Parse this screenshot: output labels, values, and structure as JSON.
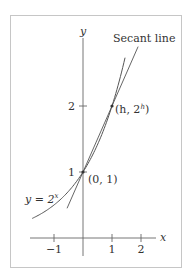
{
  "figure": {
    "frame_color": "#c6c6c6",
    "line_color": "#555555",
    "axis_color": "#666666",
    "labels": {
      "y_axis": "y",
      "x_axis": "x",
      "secant_line": "Secant line",
      "point_h": "(h, 2",
      "point_h_sup": "h",
      "point_h_close": ")",
      "point_origin": "(0, 1)",
      "curve_y": "y = 2",
      "curve_sup": "x"
    },
    "x_ticks": [
      {
        "value": -1,
        "label": "−1"
      },
      {
        "value": 1,
        "label": "1"
      },
      {
        "value": 2,
        "label": "2"
      }
    ],
    "y_ticks": [
      {
        "value": 1,
        "label": "1"
      },
      {
        "value": 2,
        "label": "2"
      }
    ]
  },
  "chart_data": {
    "type": "line",
    "title": "",
    "xlabel": "x",
    "ylabel": "y",
    "xlim": [
      -2.0,
      2.6
    ],
    "ylim": [
      -0.3,
      3.2
    ],
    "series": [
      {
        "name": "y = 2^x",
        "function": "2^x",
        "x_range": [
          -1.75,
          1.45
        ]
      },
      {
        "name": "Secant line",
        "function": "x + 1",
        "x_range": [
          -0.55,
          1.9
        ]
      }
    ],
    "points": [
      {
        "label": "(0, 1)",
        "x": 0,
        "y": 1
      },
      {
        "label": "(h, 2^h)",
        "x": 1,
        "y": 2
      }
    ]
  }
}
